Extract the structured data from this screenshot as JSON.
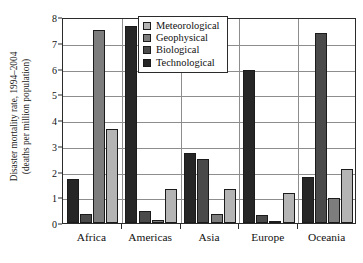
{
  "chart_data": {
    "type": "bar",
    "title": "",
    "subtitle": "",
    "xlabel": "",
    "ylabel": "Disaster mortality rate, 1994–2004 (deaths per million population)",
    "ylabel_lines": [
      "Disaster mortality rate, 1994–2004",
      "(deaths per million population)"
    ],
    "categories": [
      "Africa",
      "Americas",
      "Asia",
      "Europe",
      "Oceania"
    ],
    "ylim": [
      0,
      8
    ],
    "yticks": [
      0,
      1,
      2,
      3,
      4,
      5,
      6,
      7,
      8
    ],
    "ytick_labels": [
      "0",
      "1",
      "2",
      "3",
      "4",
      "5",
      "6",
      "7",
      "8"
    ],
    "grid": true,
    "grid_axis": "y",
    "legend_position": "top-center",
    "bar_draw_order": [
      "Technological",
      "Biological",
      "Geophysical",
      "Meteorological"
    ],
    "series": [
      {
        "name": "Meteorological",
        "color": "#b4b4b4",
        "values": [
          3.65,
          1.33,
          1.32,
          1.16,
          2.1
        ]
      },
      {
        "name": "Geophysical",
        "color": "#7d7d7d",
        "values": [
          7.48,
          0.1,
          0.35,
          0.08,
          0.97
        ]
      },
      {
        "name": "Biological",
        "color": "#4a4a4a",
        "values": [
          0.35,
          0.45,
          2.47,
          0.3,
          7.38
        ]
      },
      {
        "name": "Technological",
        "color": "#262626",
        "values": [
          1.7,
          7.64,
          2.7,
          5.94,
          1.78
        ]
      }
    ]
  },
  "legend": {
    "items": [
      {
        "label": "Meteorological",
        "color": "#b4b4b4"
      },
      {
        "label": "Geophysical",
        "color": "#7d7d7d"
      },
      {
        "label": "Biological",
        "color": "#4a4a4a"
      },
      {
        "label": "Technological",
        "color": "#262626"
      }
    ]
  },
  "style": {
    "axis_color": "#2b2b2b",
    "grid_color": "#8d8d8d",
    "bar_edge_color": "#1b1b1b",
    "background": "#ffffff"
  }
}
